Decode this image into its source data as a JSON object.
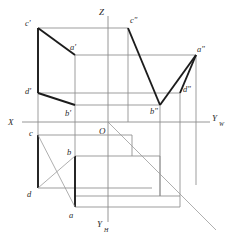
{
  "figure": {
    "type": "orthographic-projection-diagram",
    "background_color": "#ffffff",
    "thin_line_color": "#9a9a9a",
    "bold_line_color": "#1c1c1c",
    "axis_color": "#8a8a8a"
  },
  "axes": {
    "origin_label": "O",
    "origin": {
      "x": 108,
      "y": 122
    },
    "z_label": "Z",
    "z_label_pos": {
      "x": 100,
      "y": 14
    },
    "x_label": "X",
    "x_label_pos": {
      "x": 9,
      "y": 124
    },
    "yw_label": "Y",
    "yw_sub": "W",
    "yw_label_pos": {
      "x": 212,
      "y": 122
    },
    "yh_label": "Y",
    "yh_sub": "H",
    "yh_label_pos": {
      "x": 98,
      "y": 226
    },
    "horizontal_axis": {
      "x1": 22,
      "y1": 122,
      "x2": 210,
      "y2": 122
    },
    "vertical_axis": {
      "x1": 108,
      "y1": 16,
      "x2": 108,
      "y2": 222
    },
    "bisector_diagonal": {
      "x1": 108,
      "y1": 122,
      "x2": 216,
      "y2": 230
    }
  },
  "points": {
    "front_view": [
      {
        "name": "c-prime",
        "label": "c'",
        "x": 38,
        "y": 28,
        "label_x": 26,
        "label_y": 26
      },
      {
        "name": "a-prime",
        "label": "a'",
        "x": 75,
        "y": 55,
        "label_x": 70,
        "label_y": 50
      },
      {
        "name": "d-prime",
        "label": "d'",
        "x": 38,
        "y": 93,
        "label_x": 26,
        "label_y": 93
      },
      {
        "name": "b-prime",
        "label": "b'",
        "x": 75,
        "y": 105,
        "label_x": 66,
        "label_y": 114
      }
    ],
    "side_view": [
      {
        "name": "c-double-prime",
        "label": "c\"",
        "x": 128,
        "y": 28,
        "label_x": 130,
        "label_y": 23
      },
      {
        "name": "a-double-prime",
        "label": "a\"",
        "x": 196,
        "y": 55,
        "label_x": 196,
        "label_y": 51
      },
      {
        "name": "d-double-prime",
        "label": "d\"",
        "x": 180,
        "y": 93,
        "label_x": 182,
        "label_y": 92
      },
      {
        "name": "b-double-prime",
        "label": "b\"",
        "x": 160,
        "y": 105,
        "label_x": 152,
        "label_y": 112
      }
    ],
    "top_view": [
      {
        "name": "c-point",
        "label": "c",
        "x": 38,
        "y": 135,
        "label_x": 30,
        "label_y": 134
      },
      {
        "name": "b-point",
        "label": "b",
        "x": 75,
        "y": 156,
        "label_x": 68,
        "label_y": 154
      },
      {
        "name": "d-point",
        "label": "d",
        "x": 38,
        "y": 188,
        "label_x": 28,
        "label_y": 195
      },
      {
        "name": "a-point",
        "label": "a",
        "x": 75,
        "y": 207,
        "label_x": 70,
        "label_y": 216
      }
    ]
  },
  "bold_segments": [
    {
      "name": "cp-dp",
      "x1": 38,
      "y1": 28,
      "x2": 38,
      "y2": 93
    },
    {
      "name": "cp-ap",
      "x1": 38,
      "y1": 28,
      "x2": 75,
      "y2": 55
    },
    {
      "name": "dp-bp",
      "x1": 38,
      "y1": 93,
      "x2": 75,
      "y2": 105
    },
    {
      "name": "cpp-bpp",
      "x1": 128,
      "y1": 28,
      "x2": 160,
      "y2": 105
    },
    {
      "name": "app-dpp",
      "x1": 196,
      "y1": 55,
      "x2": 180,
      "y2": 93
    },
    {
      "name": "app-bpp-cross",
      "x1": 196,
      "y1": 55,
      "x2": 160,
      "y2": 105
    },
    {
      "name": "c-d",
      "x1": 38,
      "y1": 135,
      "x2": 38,
      "y2": 188
    },
    {
      "name": "b-a",
      "x1": 75,
      "y1": 156,
      "x2": 75,
      "y2": 207
    },
    {
      "name": "c-b",
      "x1": 38,
      "y1": 135,
      "x2": 75,
      "y2": 156
    },
    {
      "name": "d-a",
      "x1": 38,
      "y1": 188,
      "x2": 75,
      "y2": 207
    }
  ]
}
